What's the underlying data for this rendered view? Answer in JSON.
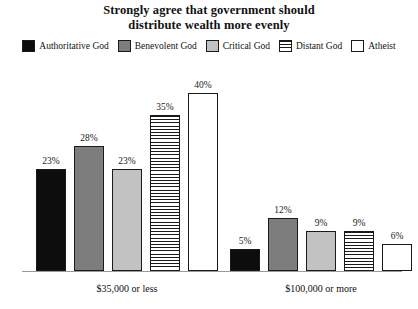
{
  "chart_data": {
    "type": "bar",
    "title": "Strongly agree that government should distribute wealth more evenly",
    "title_lines": [
      "Strongly agree that government should",
      "distribute wealth more evenly"
    ],
    "xlabel": "",
    "ylabel": "",
    "ylim": [
      0,
      44
    ],
    "grid": false,
    "legend_position": "top",
    "value_label_suffix": "%",
    "categories": [
      "$35,000 or less",
      "$100,000 or more"
    ],
    "series": [
      {
        "name": "Authoritative God",
        "values": [
          23,
          28
        ],
        "value_labels": [
          "23%",
          "5%"
        ],
        "swatch": "solid-black",
        "color": "#0d0d0d"
      },
      {
        "name": "Benevolent God",
        "values": [
          28,
          12
        ],
        "value_labels": [
          "28%",
          "12%"
        ],
        "swatch": "solid-dark-gray",
        "color": "#7d7d7d"
      },
      {
        "name": "Critical God",
        "values": [
          23,
          9
        ],
        "value_labels": [
          "23%",
          "9%"
        ],
        "swatch": "solid-light-gray",
        "color": "#c2c2c2"
      },
      {
        "name": "Distant God",
        "values": [
          35,
          9
        ],
        "value_labels": [
          "35%",
          "9%"
        ],
        "swatch": "horizontal-stripes",
        "color": "#ffffff"
      },
      {
        "name": "Atheist",
        "values": [
          40,
          6
        ],
        "value_labels": [
          "40%",
          "6%"
        ],
        "swatch": "outline-white",
        "color": "#ffffff"
      }
    ],
    "groups": [
      {
        "label": "$35,000 or less",
        "bars": [
          {
            "series": "Authoritative God",
            "value": 23,
            "label": "23%",
            "fill": "fill-black"
          },
          {
            "series": "Benevolent God",
            "value": 28,
            "label": "28%",
            "fill": "fill-dgray"
          },
          {
            "series": "Critical God",
            "value": 23,
            "label": "23%",
            "fill": "fill-lgray"
          },
          {
            "series": "Distant God",
            "value": 35,
            "label": "35%",
            "fill": "fill-stripe"
          },
          {
            "series": "Atheist",
            "value": 40,
            "label": "40%",
            "fill": "fill-white"
          }
        ]
      },
      {
        "label": "$100,000 or more",
        "bars": [
          {
            "series": "Authoritative God",
            "value": 5,
            "label": "5%",
            "fill": "fill-black"
          },
          {
            "series": "Benevolent God",
            "value": 12,
            "label": "12%",
            "fill": "fill-dgray"
          },
          {
            "series": "Critical God",
            "value": 9,
            "label": "9%",
            "fill": "fill-lgray"
          },
          {
            "series": "Distant God",
            "value": 9,
            "label": "9%",
            "fill": "fill-stripe"
          },
          {
            "series": "Atheist",
            "value": 6,
            "label": "6%",
            "fill": "fill-white"
          }
        ]
      }
    ]
  },
  "legend": {
    "items": [
      {
        "label": "Authoritative God",
        "fill": "fill-black"
      },
      {
        "label": "Benevolent God",
        "fill": "fill-dgray"
      },
      {
        "label": "Critical God",
        "fill": "fill-lgray"
      },
      {
        "label": "Distant God",
        "fill": "fill-stripe"
      },
      {
        "label": "Atheist",
        "fill": "fill-white"
      }
    ]
  },
  "colors": {
    "authoritative_god": "#0d0d0d",
    "benevolent_god": "#7d7d7d",
    "critical_god": "#c2c2c2",
    "distant_god": "#ffffff",
    "atheist": "#ffffff",
    "outline": "#1a1a1a",
    "baseline": "#9a9a9a",
    "background": "#ffffff",
    "text": "#111111"
  }
}
